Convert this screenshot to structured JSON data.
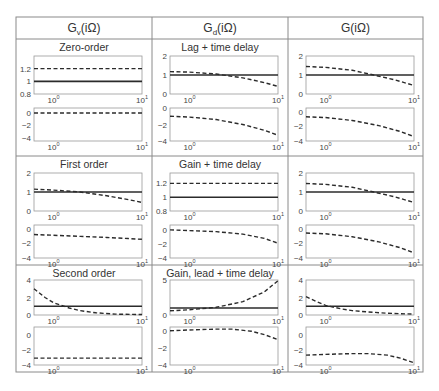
{
  "table": {
    "columns": [
      {
        "label": "G",
        "sub": "v",
        "arg": "(iΩ)"
      },
      {
        "label": "G",
        "sub": "d",
        "arg": "(iΩ)"
      },
      {
        "label": "G",
        "sub": "",
        "arg": "(iΩ)"
      }
    ],
    "row_titles": [
      "Zero-order",
      "First order",
      "Second order",
      "Lag + time delay",
      "Gain + time delay",
      "Gain, lead + time delay"
    ],
    "colors": {
      "border": "#8a8a8a",
      "axes": "#9a9a9a",
      "line": "#2b2b2b"
    }
  },
  "chart_data": {
    "type": "line",
    "x_scale": "log",
    "x_ticks": [
      "10^0",
      "10^1"
    ],
    "xlim": [
      0.6,
      10
    ],
    "legend": {
      "solid": "reference (magnitude 1)",
      "dashed": "response"
    },
    "panels": [
      {
        "row": 0,
        "col": 0,
        "title": "Zero-order",
        "mag": {
          "ylim": [
            0.8,
            1.4
          ],
          "yticks": [
            "0.8",
            "1",
            "1.2"
          ],
          "solid": [
            [
              0.6,
              1
            ],
            [
              10,
              1
            ]
          ],
          "dashed": [
            [
              0.6,
              1.2
            ],
            [
              10,
              1.2
            ]
          ]
        },
        "phase": {
          "ylim": [
            -4.5,
            0.8
          ],
          "yticks": [
            "-4",
            "-2",
            "0"
          ],
          "dashed": [
            [
              0.6,
              0
            ],
            [
              10,
              0
            ]
          ]
        }
      },
      {
        "row": 0,
        "col": 1,
        "title": "Lag + time delay",
        "mag": {
          "ylim": [
            0,
            2
          ],
          "yticks": [
            "0",
            "1",
            "2"
          ],
          "solid": [
            [
              0.6,
              1
            ],
            [
              10,
              1
            ]
          ],
          "dashed": [
            [
              0.6,
              1.18
            ],
            [
              1,
              1.15
            ],
            [
              2,
              1.05
            ],
            [
              4,
              0.85
            ],
            [
              7,
              0.6
            ],
            [
              10,
              0.4
            ]
          ]
        },
        "phase": {
          "ylim": [
            -4,
            0
          ],
          "yticks": [
            "-4",
            "-2",
            "0"
          ],
          "dashed": [
            [
              0.6,
              -1.0
            ],
            [
              1,
              -1.1
            ],
            [
              2,
              -1.4
            ],
            [
              4,
              -2.0
            ],
            [
              7,
              -2.7
            ],
            [
              10,
              -3.3
            ]
          ]
        }
      },
      {
        "row": 0,
        "col": 2,
        "title": "",
        "mag": {
          "ylim": [
            0,
            2
          ],
          "yticks": [
            "0",
            "1",
            "2"
          ],
          "solid": [
            [
              0.6,
              1
            ],
            [
              10,
              1
            ]
          ],
          "dashed": [
            [
              0.6,
              1.45
            ],
            [
              1,
              1.4
            ],
            [
              2,
              1.25
            ],
            [
              3.5,
              1.0
            ],
            [
              6,
              0.75
            ],
            [
              10,
              0.45
            ]
          ]
        },
        "phase": {
          "ylim": [
            -4,
            0.5
          ],
          "yticks": [
            "-4",
            "-2",
            "0"
          ],
          "dashed": [
            [
              0.6,
              -0.7
            ],
            [
              1,
              -0.8
            ],
            [
              2,
              -1.2
            ],
            [
              4,
              -1.9
            ],
            [
              7,
              -2.7
            ],
            [
              10,
              -3.4
            ]
          ]
        }
      },
      {
        "row": 1,
        "col": 0,
        "title": "First order",
        "mag": {
          "ylim": [
            0,
            2
          ],
          "yticks": [
            "0",
            "1",
            "2"
          ],
          "solid": [
            [
              0.6,
              1
            ],
            [
              10,
              1
            ]
          ],
          "dashed": [
            [
              0.6,
              1.15
            ],
            [
              1,
              1.1
            ],
            [
              2,
              1.0
            ],
            [
              4,
              0.8
            ],
            [
              7,
              0.6
            ],
            [
              10,
              0.45
            ]
          ]
        },
        "phase": {
          "ylim": [
            -4,
            0.5
          ],
          "yticks": [
            "-4",
            "-2",
            "0"
          ],
          "dashed": [
            [
              0.6,
              -0.8
            ],
            [
              1,
              -0.9
            ],
            [
              2,
              -1.05
            ],
            [
              4,
              -1.2
            ],
            [
              7,
              -1.35
            ],
            [
              10,
              -1.45
            ]
          ]
        }
      },
      {
        "row": 1,
        "col": 1,
        "title": "Gain + time delay",
        "mag": {
          "ylim": [
            0.8,
            1.35
          ],
          "yticks": [
            "0.8",
            "1",
            "1.2"
          ],
          "solid": [
            [
              0.6,
              1
            ],
            [
              10,
              1
            ]
          ],
          "dashed": [
            [
              0.6,
              1.2
            ],
            [
              10,
              1.2
            ]
          ]
        },
        "phase": {
          "ylim": [
            -4,
            0.7
          ],
          "yticks": [
            "-4",
            "-2",
            "0"
          ],
          "dashed": [
            [
              0.6,
              0
            ],
            [
              1,
              -0.1
            ],
            [
              2,
              -0.25
            ],
            [
              4,
              -0.6
            ],
            [
              7,
              -1.2
            ],
            [
              10,
              -1.9
            ]
          ]
        }
      },
      {
        "row": 1,
        "col": 2,
        "title": "",
        "mag": {
          "ylim": [
            0,
            2
          ],
          "yticks": [
            "0",
            "1",
            "2"
          ],
          "solid": [
            [
              0.6,
              1
            ],
            [
              10,
              1
            ]
          ],
          "dashed": [
            [
              0.6,
              1.45
            ],
            [
              1,
              1.4
            ],
            [
              2,
              1.25
            ],
            [
              3.5,
              1.0
            ],
            [
              6,
              0.75
            ],
            [
              10,
              0.45
            ]
          ]
        },
        "phase": {
          "ylim": [
            -4,
            0.5
          ],
          "yticks": [
            "-4",
            "-2",
            "0"
          ],
          "dashed": [
            [
              0.6,
              -0.6
            ],
            [
              1,
              -0.7
            ],
            [
              2,
              -1.1
            ],
            [
              4,
              -1.8
            ],
            [
              7,
              -2.6
            ],
            [
              10,
              -3.3
            ]
          ]
        }
      },
      {
        "row": 2,
        "col": 0,
        "title": "Second order",
        "mag": {
          "ylim": [
            0,
            4
          ],
          "yticks": [
            "0",
            "2",
            "4"
          ],
          "solid": [
            [
              0.6,
              1
            ],
            [
              10,
              1
            ]
          ],
          "dashed": [
            [
              0.6,
              3.0
            ],
            [
              0.8,
              2.0
            ],
            [
              1,
              1.4
            ],
            [
              1.5,
              0.8
            ],
            [
              2,
              0.5
            ],
            [
              3,
              0.25
            ],
            [
              5,
              0.1
            ],
            [
              10,
              0.05
            ]
          ]
        },
        "phase": {
          "ylim": [
            -4,
            1
          ],
          "yticks": [
            "-4",
            "-2",
            "0"
          ],
          "dashed": [
            [
              0.6,
              -3.1
            ],
            [
              10,
              -3.1
            ]
          ]
        }
      },
      {
        "row": 2,
        "col": 1,
        "title": "Gain, lead + time delay",
        "mag": {
          "ylim": [
            0,
            5
          ],
          "yticks": [
            "0",
            "5"
          ],
          "solid": [
            [
              0.6,
              1
            ],
            [
              10,
              1
            ]
          ],
          "dashed": [
            [
              0.6,
              0.6
            ],
            [
              1,
              0.75
            ],
            [
              2,
              1.1
            ],
            [
              4,
              1.9
            ],
            [
              7,
              3.3
            ],
            [
              10,
              4.9
            ]
          ]
        },
        "phase": {
          "ylim": [
            -4,
            0.5
          ],
          "yticks": [
            "-4",
            "-2",
            "0"
          ],
          "dashed": [
            [
              0.6,
              0.05
            ],
            [
              1,
              0.15
            ],
            [
              2,
              0.25
            ],
            [
              3,
              0.25
            ],
            [
              5,
              0
            ],
            [
              7,
              -0.4
            ],
            [
              10,
              -1.0
            ]
          ]
        }
      },
      {
        "row": 2,
        "col": 2,
        "title": "",
        "mag": {
          "ylim": [
            0,
            4
          ],
          "yticks": [
            "0",
            "2",
            "4"
          ],
          "solid": [
            [
              0.6,
              1
            ],
            [
              10,
              1
            ]
          ],
          "dashed": [
            [
              0.6,
              2.1
            ],
            [
              0.8,
              1.5
            ],
            [
              1,
              1.1
            ],
            [
              1.5,
              0.7
            ],
            [
              2,
              0.5
            ],
            [
              3,
              0.35
            ],
            [
              5,
              0.2
            ],
            [
              10,
              0.1
            ]
          ]
        },
        "phase": {
          "ylim": [
            -4,
            1
          ],
          "yticks": [
            "-4",
            "-2",
            "0"
          ],
          "dashed": [
            [
              0.6,
              -2.7
            ],
            [
              1,
              -2.6
            ],
            [
              2,
              -2.5
            ],
            [
              3,
              -2.5
            ],
            [
              5,
              -2.7
            ],
            [
              7,
              -3.1
            ],
            [
              10,
              -3.7
            ]
          ]
        }
      }
    ]
  }
}
